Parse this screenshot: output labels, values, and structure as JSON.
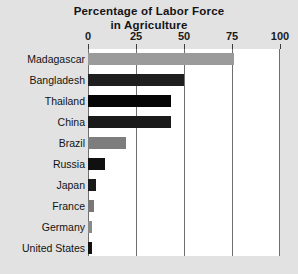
{
  "chart_data": {
    "type": "bar",
    "orientation": "horizontal",
    "title": "Percentage of Labor Force in Agriculture",
    "title_line1": "Percentage of Labor Force",
    "title_line2": "in Agriculture",
    "xlabel": "",
    "ylabel": "",
    "xlim": [
      0,
      100
    ],
    "xticks": [
      0,
      25,
      50,
      75,
      100
    ],
    "xtick_labels": [
      "0",
      "25",
      "50",
      "75",
      "100"
    ],
    "grid": true,
    "grid_axis": "x",
    "legend": false,
    "categories": [
      "Madagascar",
      "Bangladesh",
      "Thailand",
      "China",
      "Brazil",
      "Russia",
      "Japan",
      "France",
      "Germany",
      "United States"
    ],
    "values": [
      76,
      50,
      43,
      43,
      20,
      9,
      4,
      3,
      2,
      2
    ],
    "bar_colors": [
      "#9b9b9b",
      "#1f1f1f",
      "#050505",
      "#1a1a1a",
      "#7d7d7d",
      "#101010",
      "#1a1a1a",
      "#787878",
      "#8a8a8a",
      "#101010"
    ],
    "series": [
      {
        "name": "Percentage of Labor Force in Agriculture",
        "values": [
          76,
          50,
          43,
          43,
          20,
          9,
          4,
          3,
          2,
          2
        ]
      }
    ]
  },
  "colors": {
    "page_background": "#e2e2e2",
    "plot_background": "#ffffff",
    "gridline": "#6e6e6e",
    "text": "#121212",
    "tick_mark": "#3a3a3a"
  }
}
